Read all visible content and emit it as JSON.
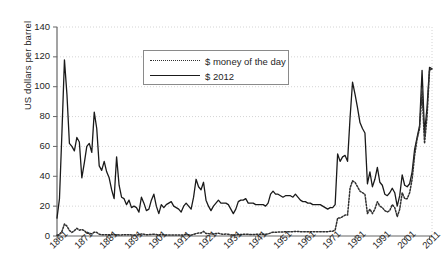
{
  "chart_data": {
    "type": "line",
    "title": "",
    "xlabel": "",
    "ylabel": "US dollars per barrel",
    "xlim": [
      1861,
      2012
    ],
    "ylim": [
      0,
      140
    ],
    "grid": true,
    "legend_position": "upper-center",
    "ytick_labels": [
      "0",
      "20",
      "40",
      "60",
      "80",
      "100",
      "120",
      "140"
    ],
    "ytick_values": [
      0,
      20,
      40,
      60,
      80,
      100,
      120,
      140
    ],
    "xtick_labels": [
      "1861",
      "1871",
      "1881",
      "1891",
      "1901",
      "1911",
      "1921",
      "1931",
      "1941",
      "1951",
      "1961",
      "1971",
      "1981",
      "1991",
      "2001",
      "2011"
    ],
    "xtick_values": [
      1861,
      1871,
      1881,
      1891,
      1901,
      1911,
      1921,
      1931,
      1941,
      1951,
      1961,
      1971,
      1981,
      1991,
      2001,
      2011
    ],
    "x": [
      1861,
      1862,
      1863,
      1864,
      1865,
      1866,
      1867,
      1868,
      1869,
      1870,
      1871,
      1872,
      1873,
      1874,
      1875,
      1876,
      1877,
      1878,
      1879,
      1880,
      1881,
      1882,
      1883,
      1884,
      1885,
      1886,
      1887,
      1888,
      1889,
      1890,
      1891,
      1892,
      1893,
      1894,
      1895,
      1896,
      1897,
      1898,
      1899,
      1900,
      1901,
      1902,
      1903,
      1904,
      1905,
      1906,
      1907,
      1908,
      1909,
      1910,
      1911,
      1912,
      1913,
      1914,
      1915,
      1916,
      1917,
      1918,
      1919,
      1920,
      1921,
      1922,
      1923,
      1924,
      1925,
      1926,
      1927,
      1928,
      1929,
      1930,
      1931,
      1932,
      1933,
      1934,
      1935,
      1936,
      1937,
      1938,
      1939,
      1940,
      1941,
      1942,
      1943,
      1944,
      1945,
      1946,
      1947,
      1948,
      1949,
      1950,
      1951,
      1952,
      1953,
      1954,
      1955,
      1956,
      1957,
      1958,
      1959,
      1960,
      1961,
      1962,
      1963,
      1964,
      1965,
      1966,
      1967,
      1968,
      1969,
      1970,
      1971,
      1972,
      1973,
      1974,
      1975,
      1976,
      1977,
      1978,
      1979,
      1980,
      1981,
      1982,
      1983,
      1984,
      1985,
      1986,
      1987,
      1988,
      1989,
      1990,
      1991,
      1992,
      1993,
      1994,
      1995,
      1996,
      1997,
      1998,
      1999,
      2000,
      2001,
      2002,
      2003,
      2004,
      2005,
      2006,
      2007,
      2008,
      2009,
      2010,
      2011,
      2012
    ],
    "series": [
      {
        "name": "$ 2012",
        "style": "solid",
        "color": "#1a1a1a",
        "values": [
          12,
          25,
          70,
          118,
          95,
          62,
          60,
          57,
          66,
          63,
          39,
          49,
          60,
          62,
          56,
          83,
          72,
          47,
          44,
          50,
          43,
          39,
          31,
          25,
          53,
          34,
          26,
          25,
          21,
          24,
          19,
          20,
          19,
          16,
          26,
          22,
          17,
          18,
          24,
          28,
          20,
          15,
          21,
          19,
          21,
          22,
          23,
          20,
          19,
          18,
          16,
          20,
          22,
          20,
          18,
          26,
          38,
          33,
          31,
          36,
          24,
          20,
          17,
          20,
          22,
          24,
          22,
          22,
          22,
          21,
          18,
          15,
          18,
          23,
          24,
          24,
          25,
          22,
          22,
          22,
          21,
          21,
          21,
          21,
          20,
          22,
          28,
          30,
          28,
          28,
          27,
          26,
          27,
          27,
          27,
          26,
          28,
          26,
          24,
          23,
          23,
          22,
          22,
          21,
          21,
          21,
          21,
          20,
          19,
          18,
          19,
          19,
          21,
          55,
          50,
          53,
          54,
          50,
          79,
          103,
          95,
          86,
          76,
          72,
          69,
          35,
          43,
          33,
          38,
          46,
          36,
          34,
          28,
          27,
          29,
          32,
          29,
          20,
          27,
          41,
          34,
          33,
          35,
          43,
          58,
          66,
          74,
          111,
          69,
          86,
          113,
          112
        ]
      },
      {
        "name": "$ money of the day",
        "style": "dotted",
        "color": "#303030",
        "values": [
          0.5,
          1.0,
          3.2,
          8.0,
          6.6,
          3.7,
          2.4,
          3.6,
          5.2,
          3.9,
          4.3,
          3.6,
          1.8,
          2.0,
          1.4,
          2.6,
          2.4,
          1.2,
          0.9,
          0.9,
          0.9,
          0.8,
          1.1,
          0.8,
          0.9,
          0.7,
          0.7,
          0.9,
          0.9,
          0.9,
          0.7,
          0.6,
          0.6,
          0.8,
          1.4,
          1.2,
          0.8,
          0.9,
          1.1,
          1.2,
          1.0,
          0.8,
          0.9,
          0.9,
          0.6,
          0.7,
          0.7,
          0.7,
          0.7,
          0.6,
          0.6,
          0.7,
          1.0,
          0.8,
          0.6,
          1.1,
          1.6,
          2.0,
          2.0,
          3.1,
          1.7,
          1.6,
          1.3,
          1.4,
          1.7,
          1.9,
          1.3,
          1.2,
          1.3,
          1.2,
          0.7,
          0.9,
          0.7,
          1.0,
          1.0,
          1.1,
          1.2,
          1.1,
          1.0,
          1.0,
          1.1,
          1.2,
          1.2,
          1.2,
          1.1,
          1.4,
          2.0,
          2.6,
          2.5,
          2.6,
          2.6,
          2.6,
          2.9,
          2.9,
          2.9,
          2.9,
          3.1,
          3.0,
          2.9,
          2.9,
          2.9,
          2.9,
          2.9,
          2.9,
          2.9,
          2.9,
          2.9,
          2.9,
          2.9,
          2.9,
          3.2,
          3.2,
          4.0,
          12.0,
          12.0,
          13.0,
          14.0,
          14.0,
          32.0,
          37.0,
          36.0,
          33.0,
          30.0,
          29.0,
          28.0,
          15.0,
          18.0,
          15.0,
          18.0,
          23.0,
          20.0,
          19.0,
          17.0,
          16.0,
          17.0,
          21.0,
          19.0,
          13.0,
          18.0,
          29.0,
          25.0,
          25.0,
          29.0,
          38.0,
          54.0,
          65.0,
          72.0,
          97.0,
          62.0,
          80.0,
          111.0,
          112.0
        ]
      }
    ]
  },
  "legend": {
    "items": [
      {
        "label": "$ money of the day"
      },
      {
        "label": "$ 2012"
      }
    ]
  }
}
